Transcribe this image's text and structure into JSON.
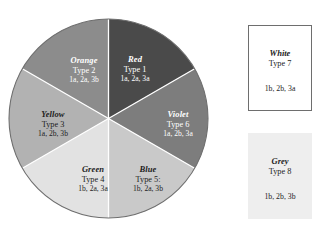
{
  "figure": {
    "background_color": "#ffffff"
  },
  "chart_data": {
    "type": "pie",
    "title": "",
    "subtitle": "",
    "xlabel": "",
    "ylabel": "",
    "legend_position": "right",
    "grid": false,
    "equal_slices": true,
    "slice_count": 6,
    "slice_angle_degrees": 60,
    "start_angle_degrees": 0,
    "direction": "clockwise",
    "categories": [
      "Red",
      "Violet",
      "Blue",
      "Green",
      "Yellow",
      "Orange"
    ],
    "values": [
      60,
      60,
      60,
      60,
      60,
      60
    ],
    "labels": [
      "Type 1",
      "Type 6",
      "Type 5:",
      "Type 4",
      "Type 3",
      "Type 2"
    ],
    "colors": [
      "#4a4a4a",
      "#7d7d7d",
      "#c9c9c9",
      "#e2e2e2",
      "#b2b2b2",
      "#8c8c8c"
    ]
  },
  "wheel": {
    "center_x": 100,
    "center_y": 100,
    "radius": 99,
    "outline_color": "#6e6e6e",
    "divider_color": "#ffffff",
    "slices": [
      {
        "key": "red",
        "name": "Red",
        "type": "Type 1",
        "code": "1a, 2a, 3a",
        "color": "#4a4a4a",
        "text_color": "#ffffff",
        "start_deg": 0,
        "end_deg": 60
      },
      {
        "key": "violet",
        "name": "Violet",
        "type": "Type 6",
        "code": "1a, 2b, 3a",
        "color": "#7d7d7d",
        "text_color": "#ffffff",
        "start_deg": 60,
        "end_deg": 120
      },
      {
        "key": "blue",
        "name": "Blue",
        "type": "Type 5:",
        "code": "1b, 2a, 3b",
        "color": "#c9c9c9",
        "text_color": "#1d1d1d",
        "start_deg": 120,
        "end_deg": 180
      },
      {
        "key": "green",
        "name": "Green",
        "type": "Type 4",
        "code": "1b, 2a, 3a",
        "color": "#e2e2e2",
        "text_color": "#1d1d1d",
        "start_deg": 180,
        "end_deg": 240
      },
      {
        "key": "yellow",
        "name": "Yellow",
        "type": "Type 3",
        "code": "1a, 2b, 3b",
        "color": "#b2b2b2",
        "text_color": "#1d1d1d",
        "start_deg": 240,
        "end_deg": 300
      },
      {
        "key": "orange",
        "name": "Orange",
        "type": "Type 2",
        "code": "1a, 2a, 3b",
        "color": "#8c8c8c",
        "text_color": "#ffffff",
        "start_deg": 300,
        "end_deg": 360
      }
    ]
  },
  "boxes": [
    {
      "key": "white",
      "name": "White",
      "type": "Type 7",
      "code": "1b, 2b, 3a",
      "fill": "#ffffff",
      "border": "#6e6e6e",
      "text_color": "#1d1d1d"
    },
    {
      "key": "grey",
      "name": "Grey",
      "type": "Type 8",
      "code": "1b, 2b, 3b",
      "fill": "#eeeeee",
      "border": "#eeeeee",
      "text_color": "#1d1d1d"
    }
  ]
}
